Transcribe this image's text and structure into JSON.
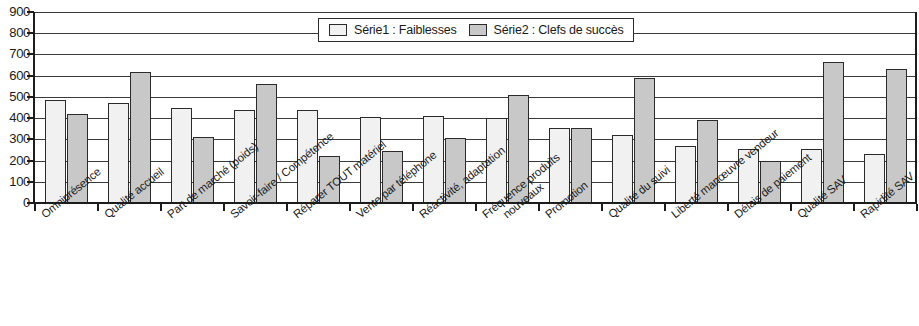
{
  "chart_data": {
    "type": "bar",
    "title": "",
    "xlabel": "",
    "ylabel": "",
    "ylim": [
      0,
      900
    ],
    "y_ticks": [
      900,
      800,
      700,
      600,
      500,
      400,
      300,
      200,
      100,
      0
    ],
    "grid": true,
    "legend_position": "top-center",
    "categories": [
      "Omniprésence",
      "Qualité accueil",
      "Part de marché (poids)",
      "Savoir-faire / Compétence",
      "Réparer TOUT matériel",
      "Vente par téléphone",
      "Réactivité, adaptation",
      "Fréquence produits nouveaux",
      "Promotion",
      "Qualité du suivi",
      "Liberté manœuvre vendeur",
      "Délais de paiement",
      "Qualité SAV",
      "Rapidité SAV"
    ],
    "category_lines": [
      [
        "Omniprésence"
      ],
      [
        "Qualité accueil"
      ],
      [
        "Part de marché (poids)"
      ],
      [
        "Savoir-faire / Compétence"
      ],
      [
        "Réparer TOUT matériel"
      ],
      [
        "Vente par téléphone"
      ],
      [
        "Réactivité, adaptation"
      ],
      [
        "Fréquence produits",
        "nouveaux"
      ],
      [
        "Promotion"
      ],
      [
        "Qualité du suivi"
      ],
      [
        "Liberté manœuvre vendeur"
      ],
      [
        "Délais de paiement"
      ],
      [
        "Qualité SAV"
      ],
      [
        "Rapidité SAV"
      ]
    ],
    "series": [
      {
        "name": "Série1 : Faiblesses",
        "color": "#f1f1f1",
        "values": [
          485,
          470,
          450,
          440,
          440,
          405,
          410,
          400,
          355,
          320,
          270,
          255,
          255,
          230
        ]
      },
      {
        "name": "Série2 : Clefs de succès",
        "color": "#c8c8c8",
        "values": [
          420,
          615,
          310,
          560,
          220,
          245,
          305,
          510,
          355,
          590,
          390,
          200,
          665,
          630
        ]
      }
    ]
  },
  "legend": {
    "entries": [
      {
        "label": "Série1 : Faiblesses",
        "swatch": "series1"
      },
      {
        "label": "Série2 : Clefs de succès",
        "swatch": "series2"
      }
    ]
  }
}
